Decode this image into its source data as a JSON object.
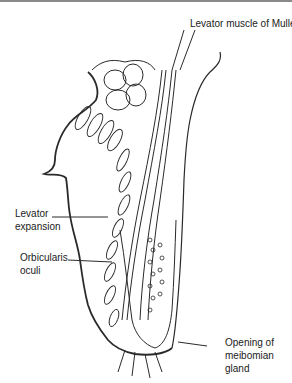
{
  "diagram": {
    "labels": {
      "levator_muller": "Levator muscle of Muller",
      "levator_expansion_1": "Levator",
      "levator_expansion_2": "expansion",
      "orbicularis_1": "Orbicularis",
      "orbicularis_2": "oculi",
      "meibomian_1": "Opening of",
      "meibomian_2": "meibomian",
      "meibomian_3": "gland"
    },
    "colors": {
      "line": "#2a2a2a",
      "background": "#ffffff",
      "text": "#1a1a1a"
    }
  }
}
